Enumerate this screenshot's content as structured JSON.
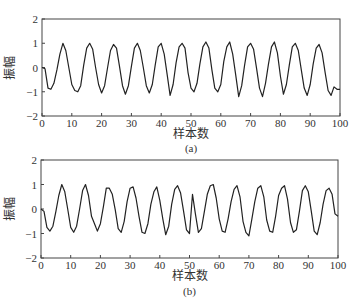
{
  "chart_data": [
    {
      "type": "line",
      "panel": "(a)",
      "caption": "(a)",
      "xlabel": "样本数",
      "ylabel": "振幅",
      "xlim": [
        0,
        100
      ],
      "ylim": [
        -2,
        2
      ],
      "xticks": [
        0,
        10,
        20,
        30,
        40,
        50,
        60,
        70,
        80,
        90,
        100
      ],
      "yticks": [
        -2,
        -1,
        0,
        1,
        2
      ],
      "grid": false,
      "series": [
        {
          "name": "signal-a",
          "x": [
            0,
            1,
            2,
            3,
            4,
            5,
            6,
            7,
            8,
            9,
            10,
            11,
            12,
            13,
            14,
            15,
            16,
            17,
            18,
            19,
            20,
            21,
            22,
            23,
            24,
            25,
            26,
            27,
            28,
            29,
            30,
            31,
            32,
            33,
            34,
            35,
            36,
            37,
            38,
            39,
            40,
            41,
            42,
            43,
            44,
            45,
            46,
            47,
            48,
            49,
            50,
            51,
            52,
            53,
            54,
            55,
            56,
            57,
            58,
            59,
            60,
            61,
            62,
            63,
            64,
            65,
            66,
            67,
            68,
            69,
            70,
            71,
            72,
            73,
            74,
            75,
            76,
            77,
            78,
            79,
            80,
            81,
            82,
            83,
            84,
            85,
            86,
            87,
            88,
            89,
            90,
            91,
            92,
            93,
            94,
            95,
            96,
            97,
            98,
            99,
            100
          ],
          "values": [
            0.0,
            -0.05,
            -0.85,
            -0.9,
            -0.65,
            -0.1,
            0.55,
            1.0,
            0.7,
            0.0,
            -0.7,
            -0.95,
            -1.0,
            -0.75,
            0.1,
            0.8,
            1.0,
            0.75,
            0.0,
            -0.7,
            -1.05,
            -0.75,
            0.0,
            0.7,
            0.95,
            0.8,
            0.05,
            -0.75,
            -1.1,
            -0.75,
            0.05,
            0.8,
            1.0,
            0.7,
            0.0,
            -0.75,
            -1.05,
            -0.7,
            0.1,
            0.85,
            1.0,
            0.55,
            -0.3,
            -1.15,
            -0.7,
            0.2,
            0.85,
            1.0,
            0.8,
            -0.2,
            -0.85,
            -1.0,
            -0.65,
            0.15,
            0.85,
            1.05,
            0.8,
            -0.1,
            -0.85,
            -1.0,
            -0.7,
            0.25,
            0.85,
            1.05,
            0.55,
            -0.3,
            -1.2,
            -0.75,
            0.1,
            0.85,
            1.0,
            0.75,
            -0.05,
            -0.85,
            -1.2,
            -0.65,
            0.15,
            0.85,
            1.05,
            0.6,
            -0.35,
            -1.1,
            -0.7,
            0.1,
            0.85,
            1.0,
            0.7,
            -0.1,
            -0.85,
            -1.15,
            -0.7,
            0.15,
            0.8,
            0.95,
            0.6,
            -0.2,
            -0.95,
            -1.15,
            -0.8,
            -0.9,
            -0.9
          ]
        }
      ]
    },
    {
      "type": "line",
      "panel": "(b)",
      "caption": "(b)",
      "xlabel": "样本数",
      "ylabel": "振幅",
      "xlim": [
        0,
        100
      ],
      "ylim": [
        -2,
        2
      ],
      "xticks": [
        0,
        10,
        20,
        30,
        40,
        50,
        60,
        70,
        80,
        90,
        100
      ],
      "yticks": [
        -2,
        -1,
        0,
        1,
        2
      ],
      "grid": false,
      "series": [
        {
          "name": "signal-b",
          "x": [
            0,
            1,
            2,
            3,
            4,
            5,
            6,
            7,
            8,
            9,
            10,
            11,
            12,
            13,
            14,
            15,
            16,
            17,
            18,
            19,
            20,
            21,
            22,
            23,
            24,
            25,
            26,
            27,
            28,
            29,
            30,
            31,
            32,
            33,
            34,
            35,
            36,
            37,
            38,
            39,
            40,
            41,
            42,
            43,
            44,
            45,
            46,
            47,
            48,
            49,
            50,
            51,
            52,
            53,
            54,
            55,
            56,
            57,
            58,
            59,
            60,
            61,
            62,
            63,
            64,
            65,
            66,
            67,
            68,
            69,
            70,
            71,
            72,
            73,
            74,
            75,
            76,
            77,
            78,
            79,
            80,
            81,
            82,
            83,
            84,
            85,
            86,
            87,
            88,
            89,
            90,
            91,
            92,
            93,
            94,
            95,
            96,
            97,
            98,
            99,
            100
          ],
          "values": [
            0.0,
            -0.1,
            -0.75,
            -0.9,
            -0.7,
            -0.1,
            0.55,
            1.0,
            0.7,
            0.0,
            -0.75,
            -0.95,
            -0.7,
            0.0,
            0.75,
            1.0,
            0.55,
            -0.3,
            -0.6,
            -0.9,
            -0.6,
            0.1,
            0.85,
            0.85,
            0.6,
            -0.05,
            -0.8,
            -0.95,
            -0.5,
            0.3,
            0.85,
            0.9,
            0.45,
            -0.3,
            -0.95,
            -1.0,
            -0.6,
            0.2,
            0.7,
            0.9,
            0.35,
            -0.4,
            -1.05,
            -0.7,
            0.2,
            0.8,
            0.95,
            0.65,
            -0.1,
            -0.85,
            -1.0,
            0.6,
            -0.2,
            -0.95,
            -0.8,
            -0.1,
            0.6,
            0.95,
            1.0,
            0.45,
            -0.4,
            -0.9,
            -0.95,
            -0.4,
            0.3,
            0.8,
            0.95,
            0.5,
            -0.5,
            -0.95,
            -1.1,
            -0.4,
            0.3,
            0.85,
            0.95,
            0.5,
            -0.45,
            -0.9,
            -0.95,
            -0.3,
            0.55,
            0.85,
            0.95,
            0.4,
            -0.55,
            -0.95,
            -0.85,
            -0.1,
            0.75,
            0.95,
            0.7,
            -0.1,
            -0.9,
            -1.05,
            -0.55,
            0.2,
            0.75,
            0.85,
            0.6,
            -0.2,
            -0.3
          ]
        }
      ]
    }
  ]
}
